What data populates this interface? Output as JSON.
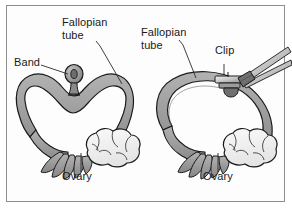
{
  "figure": {
    "border_color": "#8e8e8e",
    "background": "#ffffff"
  },
  "colors": {
    "tube_fill": "#9a9a9a",
    "tube_fill_light": "#b4b4b4",
    "tube_outline": "#1a1a1a",
    "ovary_fill": "#f2f2f2",
    "ovary_outline": "#1a1a1a",
    "band_fill": "#8f8f8f",
    "clip_fill": "#c9c9c9",
    "instrument_fill": "#e6e6e6",
    "text": "#1a1a1a",
    "leader_line": "#2b2b2b"
  },
  "panels": [
    {
      "id": "band",
      "name": "band-method-panel",
      "method": "Band",
      "labels": [
        {
          "id": "band-label",
          "text": "Band",
          "x": 14,
          "y": 62
        },
        {
          "id": "fallopian-tube-label-left",
          "text": "Fallopian\ntube",
          "x": 62,
          "y": 22
        },
        {
          "id": "ovary-label-left",
          "text": "Ovary",
          "x": 62,
          "y": 176
        }
      ]
    },
    {
      "id": "clip",
      "name": "clip-method-panel",
      "method": "Clip",
      "labels": [
        {
          "id": "fallopian-tube-label-right",
          "text": "Fallopian\ntube",
          "x": 141,
          "y": 32
        },
        {
          "id": "clip-label",
          "text": "Clip",
          "x": 215,
          "y": 50
        },
        {
          "id": "ovary-label-right",
          "text": "Ovary",
          "x": 203,
          "y": 176
        }
      ]
    }
  ],
  "anatomy_parts": {
    "fallopian_tube": "Fallopian tube",
    "ovary": "Ovary",
    "fimbriae": "Fimbriae",
    "band": "Band",
    "clip": "Clip",
    "applicator": "Clip applicator"
  }
}
